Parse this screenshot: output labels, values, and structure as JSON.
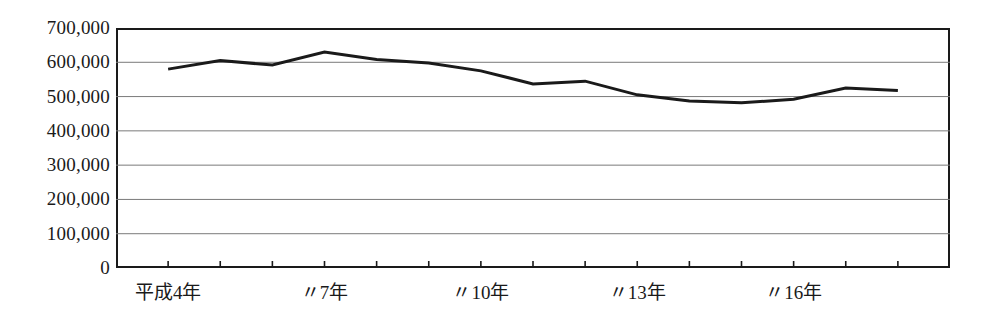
{
  "chart_data": {
    "type": "line",
    "title": "",
    "xlabel": "",
    "ylabel": "",
    "grid": true,
    "legend": "none",
    "ylim": [
      0,
      700000
    ],
    "ytick_labels": [
      "700,000",
      "600,000",
      "500,000",
      "400,000",
      "300,000",
      "200,000",
      "100,000",
      "0"
    ],
    "ytick_values": [
      700000,
      600000,
      500000,
      400000,
      300000,
      200000,
      100000,
      0
    ],
    "xtick_labels": [
      "平成4年",
      "〃7年",
      "〃10年",
      "〃13年",
      "〃16年"
    ],
    "xtick_label_positions": [
      4,
      7,
      10,
      13,
      16
    ],
    "categories": [
      4,
      5,
      6,
      7,
      8,
      9,
      10,
      11,
      12,
      13,
      14,
      15,
      16,
      17,
      18
    ],
    "category_labels": [
      "平成4年",
      "5年",
      "6年",
      "7年",
      "8年",
      "9年",
      "10年",
      "11年",
      "12年",
      "13年",
      "14年",
      "15年",
      "16年",
      "17年",
      "18年"
    ],
    "values": [
      580000,
      605000,
      592000,
      630000,
      608000,
      598000,
      575000,
      537000,
      545000,
      505000,
      487000,
      482000,
      492000,
      525000,
      518000
    ],
    "series": [
      {
        "name": "",
        "color": "#1a1a1a",
        "values": [
          580000,
          605000,
          592000,
          630000,
          608000,
          598000,
          575000,
          537000,
          545000,
          505000,
          487000,
          482000,
          492000,
          525000,
          518000
        ]
      }
    ],
    "line_color": "#1a1a1a",
    "line_width": 3,
    "grid_color": "#7a7a7a",
    "axis_color": "#1a1a1a",
    "background": "#ffffff"
  }
}
